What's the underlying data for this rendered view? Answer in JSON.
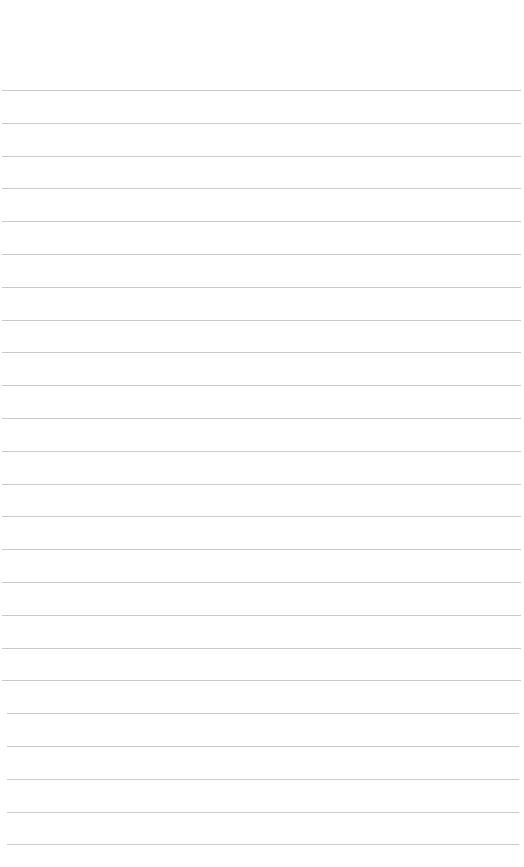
{
  "document": {
    "type": "lined-paper",
    "background_color": "#ffffff",
    "line_color": "#c9c9c9",
    "line_count": 24,
    "first_line_y": 90,
    "line_spacing": 32.8,
    "text_content": []
  }
}
